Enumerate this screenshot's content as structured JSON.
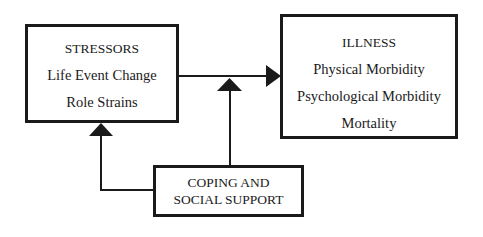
{
  "diagram": {
    "nodes": {
      "stressors": {
        "title": "STRESSORS",
        "items": [
          "Life Event Change",
          "Role Strains"
        ]
      },
      "illness": {
        "title": "ILLNESS",
        "items": [
          "Physical Morbidity",
          "Psychological Morbidity",
          "Mortality"
        ]
      },
      "coping": {
        "lines": [
          "COPING AND",
          "SOCIAL SUPPORT"
        ]
      }
    },
    "edges": [
      {
        "from": "stressors",
        "to": "illness",
        "type": "arrow"
      },
      {
        "from": "coping",
        "to": "stressors",
        "type": "arrow"
      },
      {
        "from": "coping",
        "to": "stressors-illness-link",
        "type": "arrow"
      }
    ],
    "colors": {
      "stroke": "#1a1a1a",
      "background": "#ffffff"
    }
  }
}
